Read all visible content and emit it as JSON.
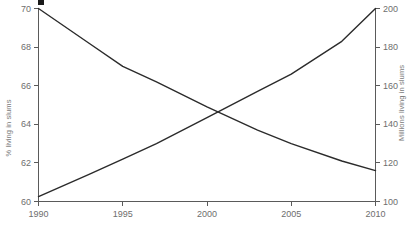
{
  "chart_data": {
    "type": "line",
    "title": "",
    "subtitle": "",
    "xlabel": "",
    "ylabel": "% living in slums",
    "y2label": "Millions living in slums",
    "grid": false,
    "legend": "none",
    "x": [
      1990,
      1995,
      2000,
      2005,
      2010
    ],
    "xlim": [
      1990,
      2010
    ],
    "xticks": [
      1990,
      1995,
      2000,
      2005,
      2010
    ],
    "xticklabels": [
      "1990",
      "1995",
      "2000",
      "2005",
      "2010"
    ],
    "ylim": [
      60,
      70
    ],
    "yticks": [
      60,
      62,
      64,
      66,
      68,
      70
    ],
    "yticklabels": [
      "60",
      "62",
      "64",
      "66",
      "68",
      "70"
    ],
    "y2lim": [
      100,
      200
    ],
    "y2ticks": [
      100,
      120,
      140,
      160,
      180,
      200
    ],
    "y2ticklabels": [
      "100",
      "120",
      "140",
      "160",
      "180",
      "200"
    ],
    "series": [
      {
        "name": "% living in slums",
        "axis": "left",
        "color": "#2b2b2b",
        "x": [
          1990,
          1993,
          1995,
          1997,
          2000,
          2003,
          2005,
          2008,
          2010
        ],
        "values": [
          70.0,
          68.2,
          67.0,
          66.2,
          64.9,
          63.7,
          63.0,
          62.1,
          61.6
        ]
      },
      {
        "name": "Millions living in slums",
        "axis": "right",
        "color": "#2b2b2b",
        "x": [
          1990,
          1993,
          1995,
          1997,
          2000,
          2003,
          2005,
          2008,
          2010
        ],
        "values": [
          102.5,
          114.0,
          122.0,
          130.0,
          143.5,
          157.0,
          166.0,
          183.0,
          200.0
        ]
      }
    ],
    "annotations": {
      "crossing_year": 2001,
      "crossing_percent": 64.6,
      "crossing_millions": 147
    }
  },
  "axes": {
    "left_title": "% living in slums",
    "right_title": "Millions living in slums"
  },
  "marks": {
    "top_fragment": "clipped-legend-swatch"
  }
}
